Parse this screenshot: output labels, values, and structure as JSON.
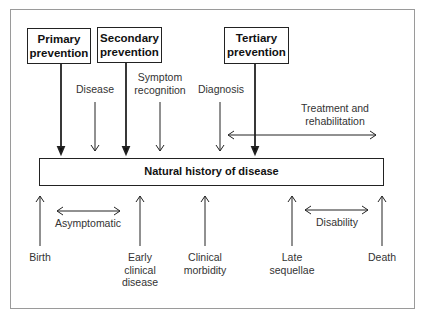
{
  "diagram": {
    "prevention_boxes": [
      {
        "id": "primary",
        "label_line1": "Primary",
        "label_line2": "prevention"
      },
      {
        "id": "secondary",
        "label_line1": "Secondary",
        "label_line2": "prevention"
      },
      {
        "id": "tertiary",
        "label_line1": "Tertiary",
        "label_line2": "prevention"
      }
    ],
    "top_labels": {
      "disease": "Disease",
      "symptom_line1": "Symptom",
      "symptom_line2": "recognition",
      "diagnosis": "Diagnosis",
      "treatment_line1": "Treatment and",
      "treatment_line2": "rehabilitation"
    },
    "main_box": "Natural history of disease",
    "bottom_labels": {
      "birth": "Birth",
      "asymptomatic": "Asymptomatic",
      "early_line1": "Early",
      "early_line2": "clinical",
      "early_line3": "disease",
      "clinical_line1": "Clinical",
      "clinical_line2": "morbidity",
      "late_line1": "Late",
      "late_line2": "sequellae",
      "disability": "Disability",
      "death": "Death"
    },
    "colors": {
      "stroke": "#222222",
      "text": "#333333",
      "frame": "#9a9a9a"
    }
  }
}
